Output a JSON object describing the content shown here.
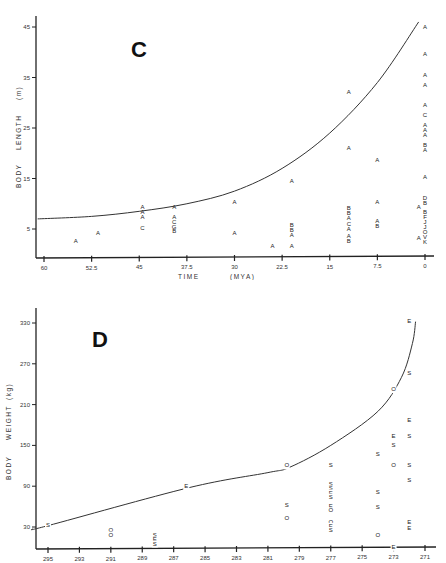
{
  "chart_data": [
    {
      "panel": "C",
      "type": "scatter",
      "title": "C",
      "xlabel": "TIME (MYA)",
      "ylabel": "BODY LENGTH (m)",
      "x_ticks": [
        "60",
        "52.5",
        "45",
        "37.5",
        "30",
        "22.5",
        "15",
        "7.5",
        "0"
      ],
      "y_ticks": [
        "45",
        "35",
        "25",
        "15",
        "5"
      ],
      "xlim": [
        61,
        0
      ],
      "ylim": [
        0,
        47
      ],
      "x_reversed": true,
      "grid": false,
      "trend_curve": [
        [
          61,
          7.0
        ],
        [
          52.5,
          7.5
        ],
        [
          45,
          8.5
        ],
        [
          37.5,
          10
        ],
        [
          30,
          12.5
        ],
        [
          22.5,
          17
        ],
        [
          15,
          24
        ],
        [
          7.5,
          34
        ],
        [
          1,
          46
        ]
      ],
      "points": [
        {
          "x": 55,
          "y": 2.5,
          "label": "A"
        },
        {
          "x": 51.5,
          "y": 4.2,
          "label": "A"
        },
        {
          "x": 44.5,
          "y": 9.2,
          "label": "A"
        },
        {
          "x": 44.5,
          "y": 8.2,
          "label": "A"
        },
        {
          "x": 44.5,
          "y": 7.2,
          "label": "A"
        },
        {
          "x": 44.5,
          "y": 5.2,
          "label": "C"
        },
        {
          "x": 39.5,
          "y": 9.2,
          "label": "A"
        },
        {
          "x": 39.5,
          "y": 7.3,
          "label": "A"
        },
        {
          "x": 39.5,
          "y": 6.3,
          "label": "C"
        },
        {
          "x": 39.5,
          "y": 5.4,
          "label": "G"
        },
        {
          "x": 39.5,
          "y": 4.6,
          "label": "B"
        },
        {
          "x": 30,
          "y": 10.2,
          "label": "A"
        },
        {
          "x": 30,
          "y": 4.2,
          "label": "A"
        },
        {
          "x": 24,
          "y": 1.6,
          "label": "A"
        },
        {
          "x": 21,
          "y": 14.4,
          "label": "A"
        },
        {
          "x": 21,
          "y": 5.8,
          "label": "B"
        },
        {
          "x": 21,
          "y": 4.8,
          "label": "B"
        },
        {
          "x": 21,
          "y": 3.8,
          "label": "A"
        },
        {
          "x": 21,
          "y": 1.6,
          "label": "A"
        },
        {
          "x": 12,
          "y": 32,
          "label": "A"
        },
        {
          "x": 12,
          "y": 21,
          "label": "A"
        },
        {
          "x": 12,
          "y": 9,
          "label": "B"
        },
        {
          "x": 12,
          "y": 8,
          "label": "B"
        },
        {
          "x": 12,
          "y": 7,
          "label": "A"
        },
        {
          "x": 12,
          "y": 6,
          "label": "C"
        },
        {
          "x": 12,
          "y": 5,
          "label": "A"
        },
        {
          "x": 12,
          "y": 3.6,
          "label": "A"
        },
        {
          "x": 12,
          "y": 2.6,
          "label": "B"
        },
        {
          "x": 7.5,
          "y": 18.5,
          "label": "A"
        },
        {
          "x": 7.5,
          "y": 10.2,
          "label": "A"
        },
        {
          "x": 7.5,
          "y": 6.5,
          "label": "A"
        },
        {
          "x": 7.5,
          "y": 5.5,
          "label": "B"
        },
        {
          "x": 1,
          "y": 9.2,
          "label": "A"
        },
        {
          "x": 1,
          "y": 3.2,
          "label": "A"
        },
        {
          "x": 0,
          "y": 45,
          "label": "A"
        },
        {
          "x": 0,
          "y": 39.5,
          "label": "A"
        },
        {
          "x": 0,
          "y": 35.5,
          "label": "A"
        },
        {
          "x": 0,
          "y": 33.5,
          "label": "A"
        },
        {
          "x": 0,
          "y": 29.5,
          "label": "A"
        },
        {
          "x": 0,
          "y": 27.5,
          "label": "C"
        },
        {
          "x": 0,
          "y": 25.5,
          "label": "A"
        },
        {
          "x": 0,
          "y": 24.5,
          "label": "A"
        },
        {
          "x": 0,
          "y": 23.5,
          "label": "A"
        },
        {
          "x": 0,
          "y": 21.5,
          "label": "B"
        },
        {
          "x": 0,
          "y": 20.5,
          "label": "A"
        },
        {
          "x": 0,
          "y": 15.2,
          "label": "A"
        },
        {
          "x": 0,
          "y": 11.0,
          "label": "D"
        },
        {
          "x": 0,
          "y": 10.0,
          "label": "B"
        },
        {
          "x": 0,
          "y": 8.2,
          "label": "B"
        },
        {
          "x": 0,
          "y": 7.3,
          "label": "F"
        },
        {
          "x": 0,
          "y": 6.3,
          "label": "J"
        },
        {
          "x": 0,
          "y": 5.3,
          "label": "J"
        },
        {
          "x": 0,
          "y": 4.3,
          "label": "O"
        },
        {
          "x": 0,
          "y": 3.3,
          "label": "V"
        },
        {
          "x": 0,
          "y": 2.3,
          "label": "K"
        }
      ]
    },
    {
      "panel": "D",
      "type": "scatter",
      "title": "D",
      "xlabel": "",
      "ylabel": "BODY WEIGHT (kg)",
      "x_ticks": [
        "295",
        "293",
        "291",
        "289",
        "287",
        "285",
        "283",
        "281",
        "279",
        "277",
        "275",
        "273",
        "271"
      ],
      "y_ticks": [
        "330",
        "270",
        "210",
        "150",
        "90",
        "30"
      ],
      "xlim": [
        296,
        270.7
      ],
      "ylim": [
        0,
        345
      ],
      "x_reversed": true,
      "grid": false,
      "trend_curve": [
        [
          296,
          27
        ],
        [
          295,
          32
        ],
        [
          286,
          88
        ],
        [
          281,
          110
        ],
        [
          279.6,
          118
        ],
        [
          277,
          150
        ],
        [
          274,
          200
        ],
        [
          272.5,
          250
        ],
        [
          271.8,
          300
        ],
        [
          271.6,
          332
        ]
      ],
      "points": [
        {
          "x": 295,
          "y": 33,
          "label": "S"
        },
        {
          "x": 291,
          "y": 25,
          "label": "O"
        },
        {
          "x": 291,
          "y": 18,
          "label": "O"
        },
        {
          "x": 288.2,
          "y": 17,
          "label": "S"
        },
        {
          "x": 288.2,
          "y": 11,
          "label": "E"
        },
        {
          "x": 288.2,
          "y": 5,
          "label": "S"
        },
        {
          "x": 286.2,
          "y": 89,
          "label": "E"
        },
        {
          "x": 279.8,
          "y": 120,
          "label": "O"
        },
        {
          "x": 279.8,
          "y": 62,
          "label": "S"
        },
        {
          "x": 279.8,
          "y": 42,
          "label": "O"
        },
        {
          "x": 277,
          "y": 120,
          "label": "S"
        },
        {
          "x": 277,
          "y": 92,
          "label": "S"
        },
        {
          "x": 277,
          "y": 86,
          "label": "S"
        },
        {
          "x": 277,
          "y": 80,
          "label": "E"
        },
        {
          "x": 277,
          "y": 74,
          "label": "S"
        },
        {
          "x": 277,
          "y": 60,
          "label": "E"
        },
        {
          "x": 277,
          "y": 54,
          "label": "O"
        },
        {
          "x": 277,
          "y": 37,
          "label": "O"
        },
        {
          "x": 277,
          "y": 31,
          "label": "E"
        },
        {
          "x": 277,
          "y": 25,
          "label": "S"
        },
        {
          "x": 274,
          "y": 136,
          "label": "S"
        },
        {
          "x": 274,
          "y": 81,
          "label": "S"
        },
        {
          "x": 274,
          "y": 59,
          "label": "S"
        },
        {
          "x": 274,
          "y": 18,
          "label": "O"
        },
        {
          "x": 273,
          "y": 232,
          "label": "O"
        },
        {
          "x": 273,
          "y": 163,
          "label": "E"
        },
        {
          "x": 273,
          "y": 150,
          "label": "S"
        },
        {
          "x": 273,
          "y": 120,
          "label": "O"
        },
        {
          "x": 273,
          "y": 0,
          "label": "E"
        },
        {
          "x": 272,
          "y": 332,
          "label": "E"
        },
        {
          "x": 272,
          "y": 256,
          "label": "S"
        },
        {
          "x": 272,
          "y": 186,
          "label": "E"
        },
        {
          "x": 272,
          "y": 163,
          "label": "S"
        },
        {
          "x": 272,
          "y": 120,
          "label": "S"
        },
        {
          "x": 272,
          "y": 98,
          "label": "S"
        },
        {
          "x": 272,
          "y": 36,
          "label": "E"
        },
        {
          "x": 272,
          "y": 28,
          "label": "E"
        }
      ]
    }
  ],
  "panel_c": {
    "letter": "C",
    "ylabel_main": "BODY",
    "ylabel_mid": "LENGTH",
    "ylabel_unit": "(m)",
    "xlabel_main": "TIME",
    "xlabel_unit": "(MYA)"
  },
  "panel_d": {
    "letter": "D",
    "ylabel_main": "BODY",
    "ylabel_mid": "WEIGHT",
    "ylabel_unit": "(kg)"
  }
}
